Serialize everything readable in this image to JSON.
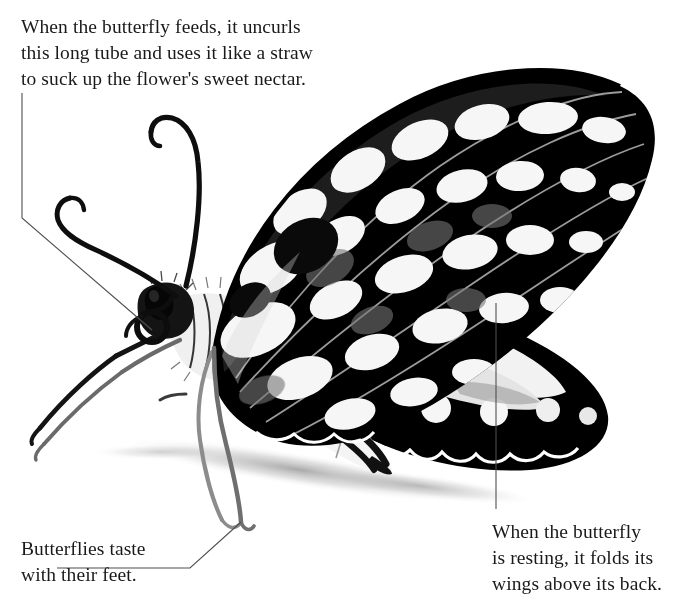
{
  "page": {
    "width": 688,
    "height": 613,
    "background": "#ffffff",
    "text_color": "#1a1a1a",
    "leader_line_color": "#555555"
  },
  "captions": {
    "proboscis": {
      "text": "When the butterfly feeds, it uncurls\nthis long tube and uses it like a straw\nto suck up the flower's sweet nectar.",
      "points_to": "coiled-proboscis"
    },
    "feet": {
      "text": "Butterflies taste\nwith their feet.",
      "points_to": "butterfly-foot"
    },
    "wings": {
      "text": "When the butterfly\nis resting, it folds its\nwings above its back.",
      "points_to": "folded-wing"
    }
  },
  "leaders": [
    {
      "name": "leader-proboscis",
      "points": "22,93 22,218 152,330"
    },
    {
      "name": "leader-feet",
      "points": "57,568 190,568 241,522"
    },
    {
      "name": "leader-wings",
      "points": "496,303 496,509"
    }
  ],
  "anatomy": {
    "antennae": 2,
    "eye": "compound-eye",
    "proboscis": "coiled-tube",
    "legs": 4,
    "wings": [
      "forewing",
      "hindwing"
    ],
    "abdomen": "striped-abdomen",
    "shadow": "cast-shadow"
  },
  "colors": {
    "black": "#000000",
    "white": "#ffffff",
    "grey_mid": "#6e6e6e",
    "grey_dark": "#2a2a2a",
    "grey_light": "#bdbdbd",
    "shadow": "#c9c9c9"
  }
}
